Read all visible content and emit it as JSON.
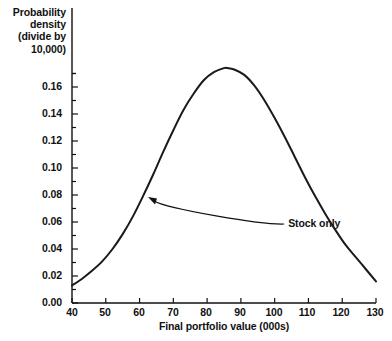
{
  "chart_data": {
    "type": "line",
    "title": "",
    "xlabel": "Final portfolio value (000s)",
    "ylabel": "Probability\ndensity\n(divide by\n10,000)",
    "xlim": [
      40,
      130
    ],
    "ylim": [
      0.0,
      0.18
    ],
    "xticks": [
      40,
      50,
      60,
      70,
      80,
      90,
      100,
      110,
      120,
      130
    ],
    "xtick_labels": [
      "40",
      "50",
      "60",
      "70",
      "80",
      "90",
      "100",
      "110",
      "120",
      "130"
    ],
    "yticks": [
      0.0,
      0.02,
      0.04,
      0.06,
      0.08,
      0.1,
      0.12,
      0.14,
      0.16
    ],
    "ytick_labels": [
      "0.00",
      "0.02",
      "0.04",
      "0.06",
      "0.08",
      "0.10",
      "0.12",
      "0.14",
      "0.16"
    ],
    "y_minor_tick_step": 0.01,
    "grid": false,
    "legend_position": "none",
    "line_color": "#1a1a1a",
    "line_width": 2.0,
    "series": [
      {
        "name": "Stock only",
        "x": [
          40,
          43,
          46,
          49,
          52,
          55,
          58,
          61,
          64,
          67,
          70,
          73,
          76,
          79,
          82,
          85,
          86,
          88,
          91,
          94,
          97,
          100,
          103,
          106,
          109,
          112,
          115,
          118,
          121,
          124,
          127,
          130
        ],
        "values": [
          0.013,
          0.018,
          0.024,
          0.031,
          0.04,
          0.051,
          0.064,
          0.079,
          0.095,
          0.112,
          0.128,
          0.143,
          0.155,
          0.165,
          0.171,
          0.174,
          0.174,
          0.173,
          0.169,
          0.161,
          0.15,
          0.137,
          0.123,
          0.108,
          0.093,
          0.079,
          0.066,
          0.054,
          0.043,
          0.034,
          0.025,
          0.016
        ]
      }
    ],
    "annotations": [
      {
        "text": "Stock only",
        "label_x": 104,
        "label_y": 0.0585,
        "target_x": 62.5,
        "target_y": 0.0785
      }
    ]
  },
  "axis_title_y": "Probability\ndensity\n(divide by\n10,000)",
  "axis_title_x": "Final portfolio value (000s)",
  "annotation_stock_only": "Stock only",
  "ytick_labels": {
    "t0": "0.00",
    "t1": "0.02",
    "t2": "0.04",
    "t3": "0.06",
    "t4": "0.08",
    "t5": "0.10",
    "t6": "0.12",
    "t7": "0.14",
    "t8": "0.16"
  },
  "xtick_labels": {
    "t0": "40",
    "t1": "50",
    "t2": "60",
    "t3": "70",
    "t4": "80",
    "t5": "90",
    "t6": "100",
    "t7": "110",
    "t8": "120",
    "t9": "130"
  }
}
